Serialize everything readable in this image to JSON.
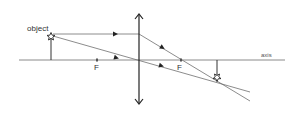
{
  "diagram": {
    "labels": {
      "object": "object",
      "axis": "axis",
      "focal_left": "F",
      "focal_right": "F"
    },
    "colors": {
      "ray": "#6e6e6e",
      "lens": "#222222",
      "axis": "#8a8a8a",
      "text": "#333333"
    },
    "geometry": {
      "axis_y": 60,
      "axis_x_start": 19,
      "axis_x_end": 285,
      "lens_x": 139,
      "lens_top_y": 14,
      "lens_bottom_y": 104,
      "object": {
        "x": 51,
        "top_y": 36
      },
      "focal_left_x": 97,
      "focal_right_x": 181,
      "image": {
        "x": 217,
        "bottom_y": 79
      }
    },
    "rays": [
      {
        "name": "parallel-ray-incident",
        "from": [
          51,
          34
        ],
        "to": [
          139,
          34
        ]
      },
      {
        "name": "parallel-ray-refracted",
        "from": [
          139,
          34
        ],
        "to": [
          250,
          101
        ]
      },
      {
        "name": "central-ray",
        "from": [
          51,
          36
        ],
        "to": [
          250,
          92
        ]
      }
    ]
  }
}
